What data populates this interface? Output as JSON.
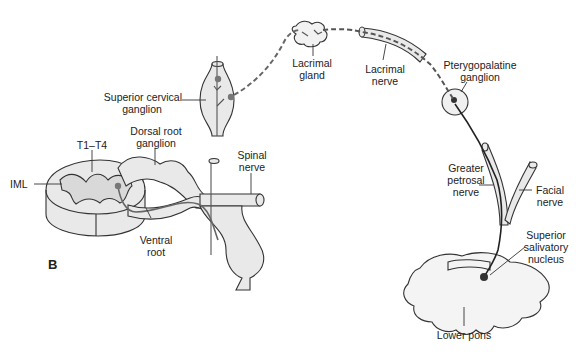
{
  "figure": {
    "panel_label": "B",
    "colors": {
      "structure_fill": "#e9e9e9",
      "outline": "#333333",
      "preganglionic": "#666666",
      "postganglionic_dashed": "#666666",
      "neuron_body": "#777777",
      "parasympathetic_fiber": "#222222",
      "background": "#ffffff"
    },
    "labels": {
      "superior_cervical_ganglion": [
        "Superior cervical",
        "ganglion"
      ],
      "dorsal_root_ganglion": [
        "Dorsal root",
        "ganglion"
      ],
      "t1_t4": "T1–T4",
      "iml": "IML",
      "spinal_nerve": [
        "Spinal",
        "nerve"
      ],
      "ventral_root": [
        "Ventral",
        "root"
      ],
      "lacrimal_gland": [
        "Lacrimal",
        "gland"
      ],
      "lacrimal_nerve": [
        "Lacrimal",
        "nerve"
      ],
      "pterygopalatine_ganglion": [
        "Pterygopalatine",
        "ganglion"
      ],
      "greater_petrosal_nerve": [
        "Greater",
        "petrosal",
        "nerve"
      ],
      "facial_nerve": [
        "Facial",
        "nerve"
      ],
      "superior_salivatory_nucleus": [
        "Superior",
        "salivatory",
        "nucleus"
      ],
      "lower_pons": "Lower pons"
    }
  }
}
